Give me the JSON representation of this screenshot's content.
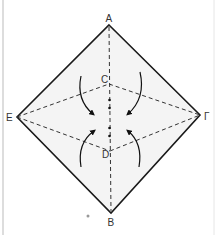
{
  "diagram": {
    "type": "origami-fold-diagram",
    "points": {
      "A": {
        "label": "A",
        "x": 109,
        "y": 25
      },
      "B": {
        "label": "B",
        "x": 111,
        "y": 213
      },
      "E": {
        "label": "E",
        "x": 17,
        "y": 117
      },
      "G": {
        "label": "Γ",
        "x": 200,
        "y": 115
      },
      "C": {
        "label": "C",
        "x": 109,
        "y": 84
      },
      "D": {
        "label": "D",
        "x": 110,
        "y": 151
      }
    },
    "colors": {
      "paper_fill": "#f4f4f4",
      "edge": "#1a1a1a",
      "fold_line": "#333333",
      "border": "#bbbbbb"
    },
    "fold_lines": [
      "A-B (valley, dashed)",
      "E-C",
      "C-Γ",
      "E-D",
      "D-Γ"
    ],
    "arrows": [
      "upper-left fold inward",
      "upper-right fold inward",
      "lower-left fold inward",
      "lower-right fold inward"
    ]
  }
}
